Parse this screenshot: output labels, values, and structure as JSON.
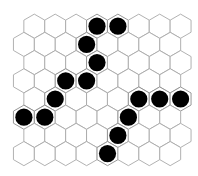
{
  "board": {
    "type": "hex",
    "rows": 8,
    "cols": 8,
    "orientation": "pointy-top",
    "layout": "offset-rows, odd rows shifted left",
    "colors": {
      "cell_fill": "#ffffff",
      "cell_stroke": "#a8a8a8",
      "stone": "#000000"
    },
    "stones": [
      {
        "row": 0,
        "col": 3,
        "color": "black"
      },
      {
        "row": 0,
        "col": 4,
        "color": "black"
      },
      {
        "row": 1,
        "col": 3,
        "color": "black"
      },
      {
        "row": 2,
        "col": 3,
        "color": "black"
      },
      {
        "row": 3,
        "col": 2,
        "color": "black"
      },
      {
        "row": 3,
        "col": 3,
        "color": "black"
      },
      {
        "row": 4,
        "col": 1,
        "color": "black"
      },
      {
        "row": 4,
        "col": 5,
        "color": "black"
      },
      {
        "row": 4,
        "col": 6,
        "color": "black"
      },
      {
        "row": 4,
        "col": 7,
        "color": "black"
      },
      {
        "row": 5,
        "col": 0,
        "color": "black"
      },
      {
        "row": 5,
        "col": 1,
        "color": "black"
      },
      {
        "row": 5,
        "col": 5,
        "color": "black"
      },
      {
        "row": 6,
        "col": 4,
        "color": "black"
      },
      {
        "row": 7,
        "col": 4,
        "color": "black"
      }
    ]
  }
}
